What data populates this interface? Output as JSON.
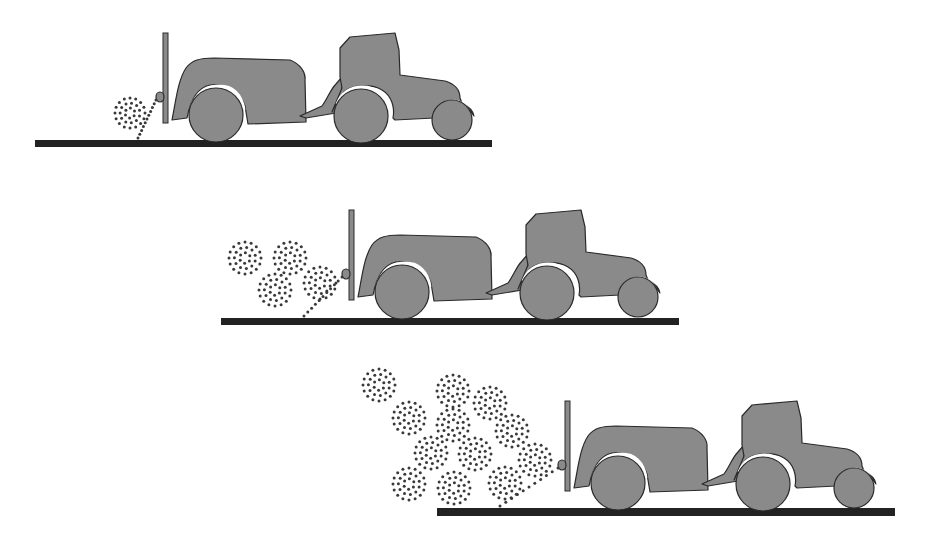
{
  "diagram": {
    "title": "Spray drift increasing with tractor sprayer travel",
    "colors": {
      "background": "#ffffff",
      "vehicle_fill": "#8a8a8a",
      "outline": "#2a2a2a",
      "ground": "#222222",
      "droplets": "#3a3a3a"
    },
    "panels": [
      {
        "id": "stage-1",
        "offset": [
          0,
          0
        ],
        "ground": {
          "x1": 35,
          "x2": 492,
          "y": 140,
          "h": 7
        },
        "clouds": [
          {
            "cx": 130,
            "cy": 113,
            "r": 15
          }
        ]
      },
      {
        "id": "stage-2",
        "offset": [
          186,
          177
        ],
        "ground": {
          "x1": 221,
          "x2": 679,
          "y": 318,
          "h": 7
        },
        "clouds": [
          {
            "cx": 245,
            "cy": 258,
            "r": 16
          },
          {
            "cx": 290,
            "cy": 258,
            "r": 16
          },
          {
            "cx": 275,
            "cy": 290,
            "r": 16
          },
          {
            "cx": 320,
            "cy": 283,
            "r": 16
          }
        ]
      },
      {
        "id": "stage-3",
        "offset": [
          402,
          368
        ],
        "ground": {
          "x1": 437,
          "x2": 895,
          "y": 508,
          "h": 8
        },
        "clouds": [
          {
            "cx": 379,
            "cy": 385,
            "r": 16
          },
          {
            "cx": 453,
            "cy": 391,
            "r": 16
          },
          {
            "cx": 490,
            "cy": 403,
            "r": 16
          },
          {
            "cx": 409,
            "cy": 418,
            "r": 16
          },
          {
            "cx": 453,
            "cy": 425,
            "r": 16
          },
          {
            "cx": 512,
            "cy": 431,
            "r": 16
          },
          {
            "cx": 431,
            "cy": 453,
            "r": 16
          },
          {
            "cx": 475,
            "cy": 454,
            "r": 16
          },
          {
            "cx": 535,
            "cy": 460,
            "r": 16
          },
          {
            "cx": 409,
            "cy": 484,
            "r": 16
          },
          {
            "cx": 454,
            "cy": 488,
            "r": 16
          },
          {
            "cx": 505,
            "cy": 483,
            "r": 16
          }
        ]
      }
    ]
  }
}
